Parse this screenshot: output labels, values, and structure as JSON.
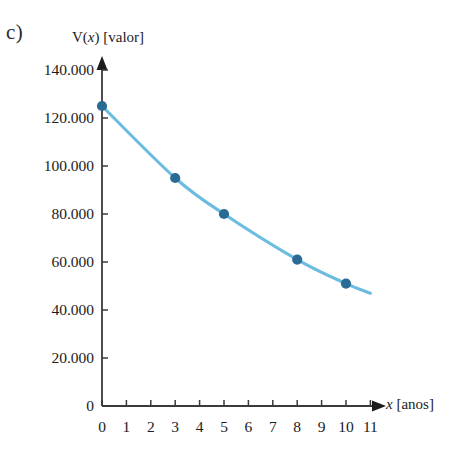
{
  "figure": {
    "item_label": "c)",
    "background_color": "#ffffff"
  },
  "chart_data": {
    "type": "line",
    "title": "",
    "subtitle": "",
    "xlabel": "x [anos]",
    "ylabel": "V(x) [valor]",
    "ylabel_parts": {
      "prefix": "V(",
      "variable": "x",
      "suffix": ") [valor]"
    },
    "xlabel_parts": {
      "variable": "x",
      "suffix": " [anos]"
    },
    "x": [
      0,
      3,
      5,
      8,
      10
    ],
    "values": [
      125000,
      95000,
      80000,
      61000,
      51000
    ],
    "series": [
      {
        "name": "V(x)",
        "x": [
          0,
          3,
          5,
          8,
          10
        ],
        "values": [
          125000,
          95000,
          80000,
          61000,
          51000
        ],
        "line_color": "#6bbce0",
        "marker_color": "#2a6b96"
      }
    ],
    "curve_extends_to_x": 11.0,
    "curve_extends_to_value": 47000,
    "xlim": [
      0,
      11.6
    ],
    "ylim": [
      0,
      148000
    ],
    "x_ticks": [
      0,
      1,
      2,
      3,
      4,
      5,
      6,
      7,
      8,
      9,
      10,
      11
    ],
    "x_tick_labels": [
      "0",
      "1",
      "2",
      "3",
      "4",
      "5",
      "6",
      "7",
      "8",
      "9",
      "10",
      "11"
    ],
    "y_ticks": [
      0,
      20000,
      40000,
      60000,
      80000,
      100000,
      120000,
      140000
    ],
    "y_tick_labels": [
      "0",
      "20.000",
      "40.000",
      "60.000",
      "80.000",
      "100.000",
      "120.000",
      "140.000"
    ],
    "grid": false,
    "legend": null,
    "legend_position": "none",
    "annotations": [],
    "axis_color": "#3a3a3a",
    "axis_arrow_x": true,
    "axis_arrow_y": true
  }
}
